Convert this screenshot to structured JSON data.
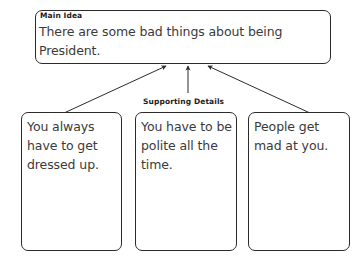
{
  "diagram": {
    "main": {
      "label": "Main Idea",
      "text": "There are some bad things about being President."
    },
    "supporting": {
      "label": "Supporting Details",
      "details": [
        {
          "text": "You always have to get dressed up."
        },
        {
          "text": "You have to be polite all the time."
        },
        {
          "text": "People get mad at you."
        }
      ]
    },
    "colors": {
      "border": "#2b2b2b",
      "text": "#3a3a3a",
      "label": "#1b1b1b",
      "background": "#ffffff"
    }
  }
}
